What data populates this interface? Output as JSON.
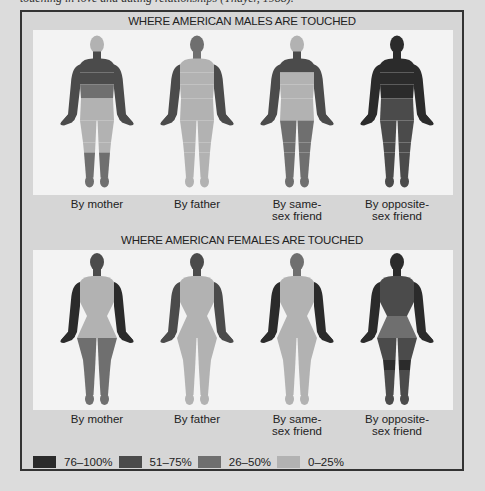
{
  "caption_fragment": "touching in love and dating relationships (Thayer, 1988).",
  "colors": {
    "76-100": "#2b2b2b",
    "51-75": "#4b4b4b",
    "26-50": "#6f6f6f",
    "0-25": "#b2b2b2"
  },
  "legend": [
    {
      "key": "76-100",
      "label": "76–100%"
    },
    {
      "key": "51-75",
      "label": "51–75%"
    },
    {
      "key": "26-50",
      "label": "26–50%"
    },
    {
      "key": "0-25",
      "label": "0–25%"
    }
  ],
  "males": {
    "title": "WHERE AMERICAN MALES ARE TOUCHED",
    "figures": [
      {
        "label_line1": "By mother",
        "label_line2": "",
        "zones": {
          "head": "0-25",
          "neck": "51-75",
          "shoulders": "51-75",
          "chest": "51-75",
          "abdomen": "26-50",
          "pelvis": "0-25",
          "thighs": "0-25",
          "knees": "0-25",
          "lower_legs": "26-50",
          "feet": "26-50",
          "arms": "51-75",
          "hands": "51-75"
        }
      },
      {
        "label_line1": "By father",
        "label_line2": "",
        "zones": {
          "head": "26-50",
          "neck": "26-50",
          "shoulders": "0-25",
          "chest": "0-25",
          "abdomen": "0-25",
          "pelvis": "0-25",
          "thighs": "0-25",
          "knees": "0-25",
          "lower_legs": "0-25",
          "feet": "0-25",
          "arms": "51-75",
          "hands": "51-75"
        }
      },
      {
        "label_line1": "By same-",
        "label_line2": "sex friend",
        "zones": {
          "head": "0-25",
          "neck": "51-75",
          "shoulders": "51-75",
          "chest": "0-25",
          "abdomen": "0-25",
          "pelvis": "0-25",
          "thighs": "26-50",
          "knees": "26-50",
          "lower_legs": "26-50",
          "feet": "26-50",
          "arms": "51-75",
          "hands": "51-75"
        }
      },
      {
        "label_line1": "By opposite-",
        "label_line2": "sex friend",
        "zones": {
          "head": "76-100",
          "neck": "76-100",
          "shoulders": "76-100",
          "chest": "76-100",
          "abdomen": "76-100",
          "pelvis": "51-75",
          "thighs": "51-75",
          "knees": "51-75",
          "lower_legs": "51-75",
          "feet": "51-75",
          "arms": "76-100",
          "hands": "76-100"
        }
      }
    ]
  },
  "females": {
    "title": "WHERE AMERICAN FEMALES ARE TOUCHED",
    "figures": [
      {
        "label_line1": "By mother",
        "label_line2": "",
        "zones": {
          "head": "51-75",
          "neck": "51-75",
          "shoulders": "0-25",
          "chest": "0-25",
          "abdomen": "0-25",
          "pelvis": "0-25",
          "thighs": "26-50",
          "knees": "26-50",
          "lower_legs": "26-50",
          "feet": "26-50",
          "arms": "76-100",
          "hands": "76-100"
        }
      },
      {
        "label_line1": "By father",
        "label_line2": "",
        "zones": {
          "head": "51-75",
          "neck": "51-75",
          "shoulders": "0-25",
          "chest": "0-25",
          "abdomen": "0-25",
          "pelvis": "0-25",
          "thighs": "0-25",
          "knees": "0-25",
          "lower_legs": "0-25",
          "feet": "0-25",
          "arms": "51-75",
          "hands": "51-75"
        }
      },
      {
        "label_line1": "By same-",
        "label_line2": "sex friend",
        "zones": {
          "head": "26-50",
          "neck": "26-50",
          "shoulders": "0-25",
          "chest": "0-25",
          "abdomen": "0-25",
          "pelvis": "0-25",
          "thighs": "0-25",
          "knees": "0-25",
          "lower_legs": "0-25",
          "feet": "0-25",
          "arms": "76-100",
          "hands": "76-100"
        }
      },
      {
        "label_line1": "By opposite-",
        "label_line2": "sex friend",
        "zones": {
          "head": "76-100",
          "neck": "76-100",
          "shoulders": "51-75",
          "chest": "51-75",
          "abdomen": "51-75",
          "pelvis": "26-50",
          "thighs": "51-75",
          "knees": "76-100",
          "lower_legs": "51-75",
          "feet": "51-75",
          "arms": "76-100",
          "hands": "76-100"
        }
      }
    ]
  }
}
